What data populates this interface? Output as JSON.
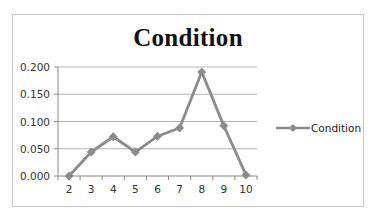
{
  "chart_data": {
    "type": "line",
    "title": "Condition",
    "xlabel": "",
    "ylabel": "",
    "categories": [
      "2",
      "3",
      "4",
      "5",
      "6",
      "7",
      "8",
      "9",
      "10"
    ],
    "series": [
      {
        "name": "Condition",
        "values": [
          0.0,
          0.044,
          0.072,
          0.044,
          0.073,
          0.088,
          0.191,
          0.092,
          0.002
        ],
        "color": "#8c8c8c",
        "marker": "diamond"
      }
    ],
    "ylim": [
      0,
      0.2
    ],
    "yticks": [
      "0.000",
      "0.050",
      "0.100",
      "0.150",
      "0.200"
    ],
    "grid": true,
    "legend_position": "right"
  },
  "title": "Condition",
  "legend": {
    "label": "Condition"
  },
  "colors": {
    "series": "#8c8c8c",
    "grid": "#b4b4b4",
    "border": "#c8c8c8"
  }
}
